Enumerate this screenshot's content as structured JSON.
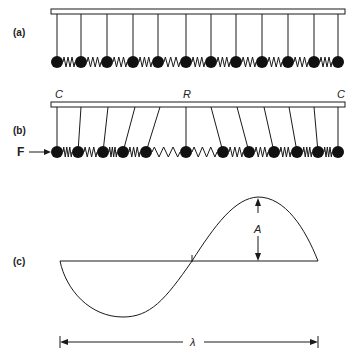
{
  "panels": {
    "a": {
      "label": "(a)",
      "description": "Row of pendulums at rest, bobs coupled by springs",
      "pendulum_count": 12,
      "pivot_x": [
        57,
        81,
        107,
        133,
        158,
        186,
        211,
        236,
        262,
        288,
        314,
        338
      ],
      "bob_x": [
        57,
        81,
        107,
        133,
        158,
        186,
        211,
        236,
        262,
        288,
        314,
        338
      ]
    },
    "b": {
      "label": "(b)",
      "force_label": "F",
      "support_labels": {
        "left": "C",
        "middle": "R",
        "right": "C"
      },
      "description": "Pendulums displaced by applied force F producing compression (C) and rarefaction (R)",
      "pivot_x": [
        57,
        81,
        108,
        135,
        160,
        186,
        211,
        237,
        264,
        289,
        314,
        338
      ],
      "bob_x": [
        57,
        78,
        103,
        123,
        146,
        186,
        223,
        249,
        274,
        297,
        318,
        338
      ]
    },
    "c": {
      "label": "(c)",
      "amplitude_label": "A",
      "wavelength_label": "λ",
      "description": "One full sine wavelength with amplitude A and wavelength λ"
    }
  },
  "colors": {
    "ink": "#1a1a1a",
    "background": "#ffffff"
  }
}
